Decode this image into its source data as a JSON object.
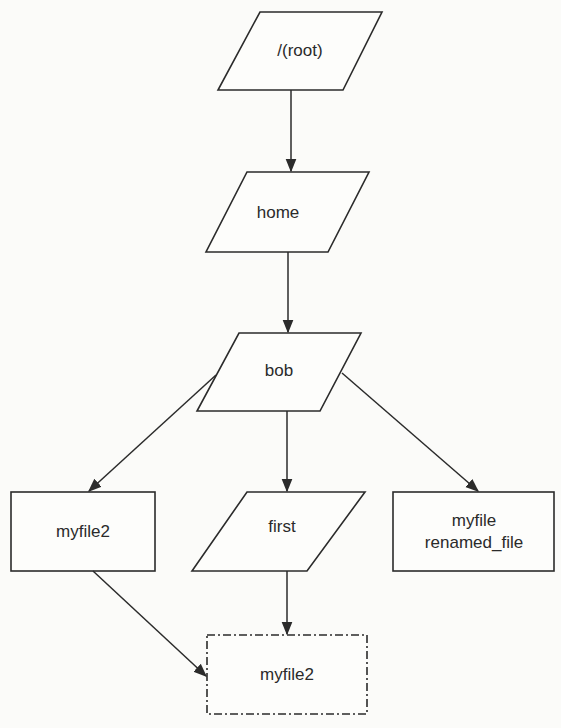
{
  "diagram": {
    "title": "",
    "colors": {
      "stroke": "#2b2b2b",
      "background": "#fbfbf9",
      "text": "#2a2a2a"
    },
    "nodes": [
      {
        "id": "root",
        "shape": "parallelogram",
        "label": "/(root)"
      },
      {
        "id": "home",
        "shape": "parallelogram",
        "label": "home"
      },
      {
        "id": "bob",
        "shape": "parallelogram",
        "label": "bob"
      },
      {
        "id": "myfile2",
        "shape": "rectangle",
        "label": "myfile2"
      },
      {
        "id": "first",
        "shape": "parallelogram",
        "label": "first"
      },
      {
        "id": "myfile_renamed",
        "shape": "rectangle",
        "label_line1": "myfile",
        "label_line2": "renamed_file"
      },
      {
        "id": "myfile2_link",
        "shape": "dashed-rectangle",
        "label": "myfile2"
      }
    ],
    "edges": [
      {
        "from": "root",
        "to": "home"
      },
      {
        "from": "home",
        "to": "bob"
      },
      {
        "from": "bob",
        "to": "myfile2"
      },
      {
        "from": "bob",
        "to": "first"
      },
      {
        "from": "bob",
        "to": "myfile_renamed"
      },
      {
        "from": "myfile2",
        "to": "myfile2_link"
      },
      {
        "from": "first",
        "to": "myfile2_link"
      }
    ]
  }
}
